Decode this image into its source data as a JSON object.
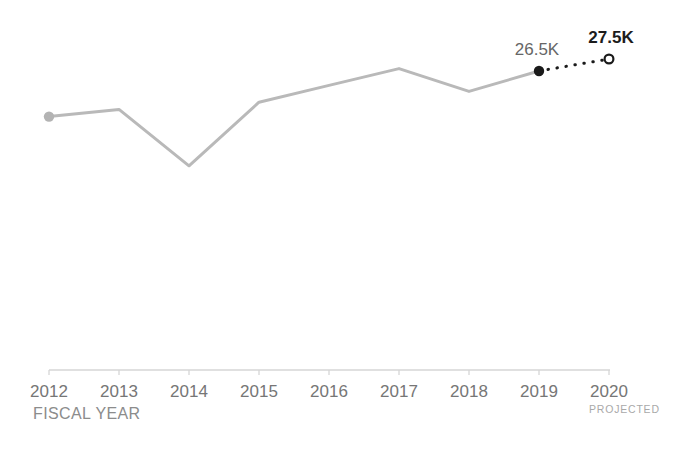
{
  "colors": {
    "background": "#ffffff",
    "actual_line": "#b9b9b9",
    "start_dot": "#b3b3b3",
    "end_dot": "#1a1a1a",
    "projected_line": "#1a1a1a",
    "open_circle_stroke": "#1a1a1a",
    "open_circle_fill": "#ffffff",
    "axis": "#d6d6d6",
    "tick_label": "#767676",
    "annotation_actual": "#666666",
    "annotation_projected": "#1c1c1c",
    "xlabel": "#8c8c8c",
    "projected_caption": "#a9a9a9"
  },
  "axis": {
    "title": "FISCAL YEAR",
    "projected_caption": "PROJECTED"
  },
  "chart_data": {
    "type": "line",
    "title": "",
    "xlabel": "FISCAL YEAR",
    "ylabel": "",
    "unit": "K",
    "grid": false,
    "legend": "none",
    "years": [
      2012,
      2013,
      2014,
      2015,
      2016,
      2017,
      2018,
      2019,
      2020
    ],
    "tick_labels": [
      "2012",
      "2013",
      "2014",
      "2015",
      "2016",
      "2017",
      "2018",
      "2019",
      "2020"
    ],
    "ylim_estimate": [
      17,
      28.5
    ],
    "series": [
      {
        "name": "actual",
        "style": "solid",
        "color_key": "actual_line",
        "years": [
          2012,
          2013,
          2014,
          2015,
          2016,
          2017,
          2018,
          2019
        ],
        "values": [
          22.7,
          23.3,
          18.6,
          23.9,
          25.3,
          26.7,
          24.8,
          26.5
        ]
      },
      {
        "name": "projected",
        "style": "dotted",
        "color_key": "projected_line",
        "years": [
          2019,
          2020
        ],
        "values": [
          26.5,
          27.5
        ]
      }
    ],
    "markers": [
      {
        "name": "start-point-marker",
        "year": 2012,
        "value": 22.7,
        "kind": "filled",
        "color_key": "start_dot"
      },
      {
        "name": "actual-end-point-marker",
        "year": 2019,
        "value": 26.5,
        "kind": "filled",
        "color_key": "end_dot"
      },
      {
        "name": "projected-point-marker",
        "year": 2020,
        "value": 27.5,
        "kind": "open",
        "color_key": "open_circle_stroke"
      }
    ],
    "annotations": [
      {
        "year": 2019,
        "value": 26.5,
        "label": "26.5K",
        "bold": false,
        "dx": -2
      },
      {
        "year": 2020,
        "value": 27.5,
        "label": "27.5K",
        "bold": true,
        "dx": 2
      }
    ]
  }
}
